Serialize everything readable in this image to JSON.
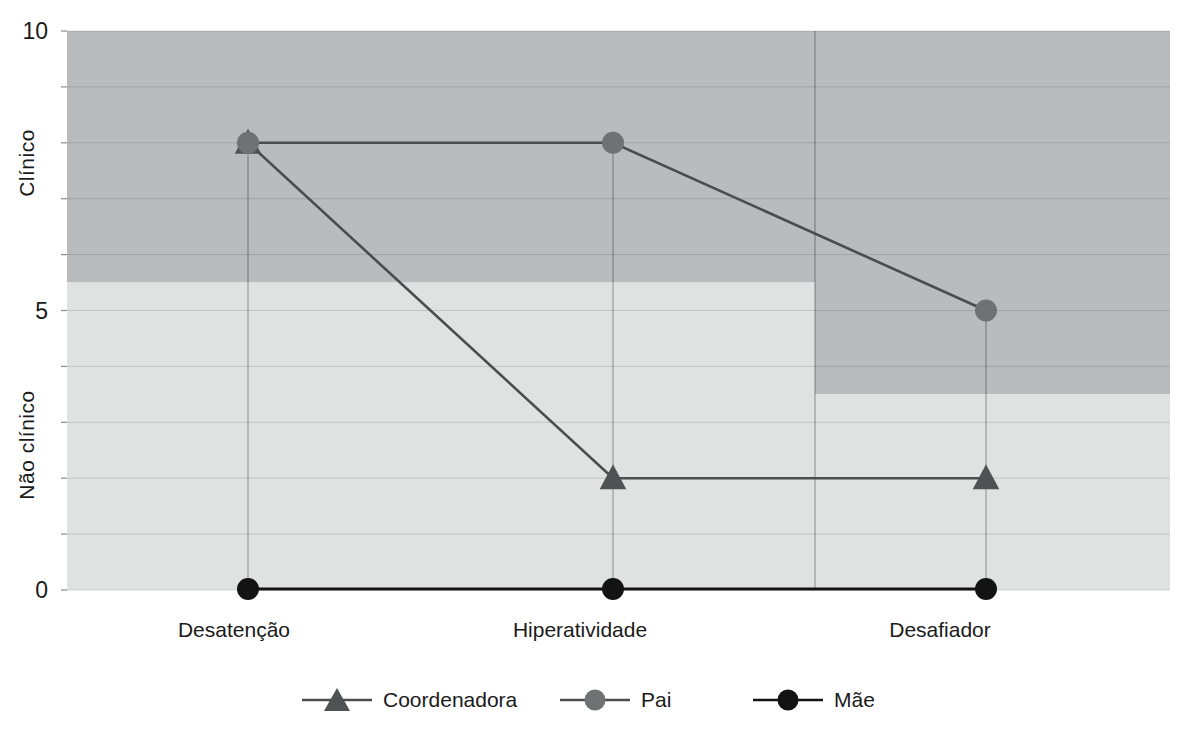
{
  "chart_data": {
    "type": "line",
    "title": "",
    "categories": [
      "Desatenção",
      "Hiperatividade",
      "Desafiador"
    ],
    "series": [
      {
        "name": "Coordenadora",
        "marker": "triangle",
        "marker_color": "#4e5252",
        "line_color": "#494d4d",
        "values": [
          8,
          2,
          2
        ]
      },
      {
        "name": "Pai",
        "marker": "circle",
        "marker_color": "#6e7272",
        "line_color": "#494d4d",
        "values": [
          8,
          8,
          5
        ]
      },
      {
        "name": "Mãe",
        "marker": "circle",
        "marker_color": "#131313",
        "line_color": "#131313",
        "values": [
          0,
          0,
          0
        ]
      }
    ],
    "ylim": [
      0,
      10
    ],
    "gridline_step": 1,
    "grid": true,
    "ytick_values": [
      10,
      5,
      0
    ],
    "ytick_labels": [
      "10",
      "5",
      "0"
    ],
    "y_zone_labels": [
      {
        "text": "Clínico",
        "center_value": 7.6
      },
      {
        "text": "Não clínico",
        "center_value": 2.6
      }
    ],
    "clinical_cutoff_bands": [
      {
        "categories": [
          "Desatenção",
          "Hiperatividade"
        ],
        "threshold": 5.5
      },
      {
        "categories": [
          "Desafiador"
        ],
        "threshold": 3.5
      }
    ],
    "legend_position": "bottom",
    "colors": {
      "above_cutoff_band": "#b9bcbc",
      "below_cutoff_band": "#e0e2e2",
      "gridline": "rgba(0,0,0,0.13)",
      "axis_tick": "rgba(0,0,0,0.45)",
      "divider_line": "rgba(0,0,0,0.30)",
      "dropline": "rgba(0,0,0,0.28)",
      "text": "#1a1a1a",
      "background": "#ffffff"
    }
  }
}
